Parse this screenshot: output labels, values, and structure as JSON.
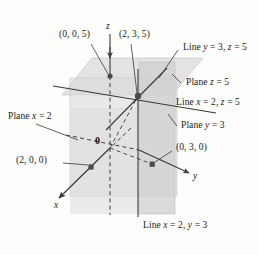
{
  "figure": {
    "width": 258,
    "height": 255,
    "background": "#fdfdfc",
    "ink": "#3a3a3a",
    "plane_fill": "#d8d8d8",
    "plane_fill_light": "#e4e4e4",
    "plane_stroke": "#bdbdbd"
  },
  "axes": [
    {
      "name": "z-axis",
      "label": "z"
    },
    {
      "name": "y-axis",
      "label": "y"
    },
    {
      "name": "x-axis",
      "label": "x"
    }
  ],
  "origin": {
    "label": "0"
  },
  "points": [
    {
      "name": "point-0-0-5",
      "label": "(0, 0, 5)"
    },
    {
      "name": "point-2-3-5",
      "label": "(2, 3, 5)"
    },
    {
      "name": "point-2-0-0",
      "label": "(2, 0, 0)"
    },
    {
      "name": "point-0-3-0",
      "label": "(0, 3, 0)"
    }
  ],
  "annotations": [
    {
      "name": "line-y3-z5",
      "label": "Line y = 3, z = 5"
    },
    {
      "name": "plane-z5",
      "label": "Plane z = 5"
    },
    {
      "name": "line-x2-z5",
      "label": "Line x = 2, z = 5"
    },
    {
      "name": "plane-y3",
      "label": "Plane y = 3"
    },
    {
      "name": "plane-x2",
      "label": "Plane x = 2"
    },
    {
      "name": "line-x2-y3",
      "label": "Line x = 2, y = 3"
    }
  ],
  "labels": {
    "z_axis": "z",
    "y_axis": "y",
    "x_axis": "x",
    "origin": "0",
    "p005": "(0, 0, 5)",
    "p235": "(2, 3, 5)",
    "p200": "(2, 0, 0)",
    "p030": "(0, 3, 0)",
    "line_y3_z5_a": "Line ",
    "line_y3_z5_y": "y",
    "line_y3_z5_b": " = 3, ",
    "line_y3_z5_z": "z",
    "line_y3_z5_c": " = 5",
    "plane_z5_a": "Plane ",
    "plane_z5_z": "z",
    "plane_z5_b": " = 5",
    "line_x2_z5_a": "Line ",
    "line_x2_z5_x": "x",
    "line_x2_z5_b": " = 2, ",
    "line_x2_z5_z": "z",
    "line_x2_z5_c": " = 5",
    "plane_y3_a": "Plane ",
    "plane_y3_y": "y",
    "plane_y3_b": " = 3",
    "plane_x2_a": "Plane ",
    "plane_x2_x": "x",
    "plane_x2_b": " = 2",
    "line_x2_y3_a": "Line ",
    "line_x2_y3_x": "x",
    "line_x2_y3_b": " = 2, ",
    "line_x2_y3_y": "y",
    "line_x2_y3_c": " = 3"
  }
}
